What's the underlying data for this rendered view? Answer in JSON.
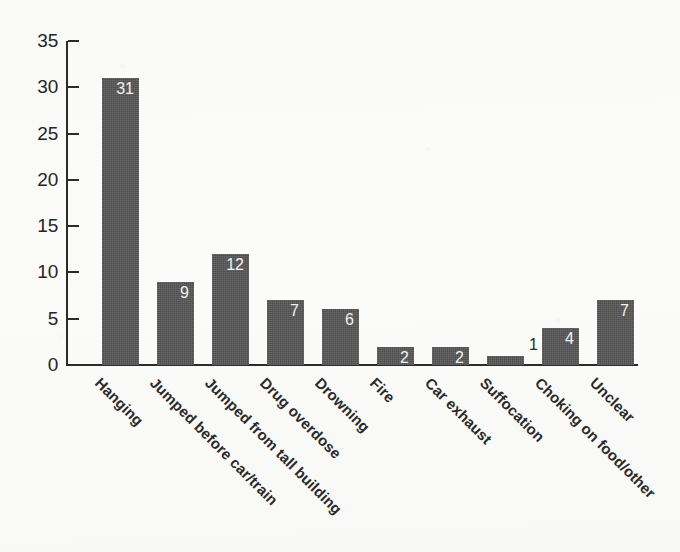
{
  "chart_data": {
    "type": "bar",
    "title": "",
    "subtitle": "",
    "xlabel": "",
    "ylabel": "",
    "ylim": [
      0,
      35
    ],
    "y_ticks": [
      0,
      5,
      10,
      15,
      20,
      25,
      30,
      35
    ],
    "grid": false,
    "legend": false,
    "orientation": "vertical",
    "bar_color": "#4d4d4d",
    "background_color": "#fbfbfa",
    "axis_color": "#2b2b2b",
    "data_label_color_inside": "#f2f2f2",
    "data_label_color_above": "#2b2b2b",
    "category_label_rotation_deg": 45,
    "categories": [
      "Hanging",
      "Jumped before car/train",
      "Jumped from tall building",
      "Drug overdose",
      "Drowning",
      "Fire",
      "Car exhaust",
      "Suffocation",
      "Choking on food/other",
      "Unclear"
    ],
    "values": [
      31,
      9,
      12,
      7,
      6,
      2,
      2,
      1,
      4,
      7
    ],
    "data_labels": [
      "31",
      "9",
      "12",
      "7",
      "6",
      "2",
      "2",
      "1",
      "4",
      "7"
    ],
    "data_label_placement": [
      "inside",
      "inside",
      "inside",
      "inside",
      "inside",
      "inside",
      "inside",
      "above",
      "inside",
      "inside"
    ],
    "y_tick_labels": [
      "0",
      "5",
      "10",
      "15",
      "20",
      "25",
      "30",
      "35"
    ]
  }
}
